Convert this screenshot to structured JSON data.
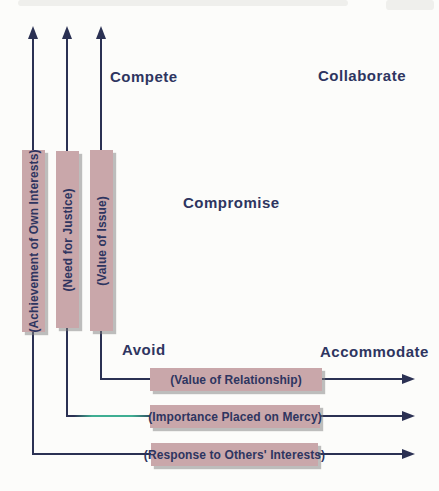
{
  "diagram": {
    "title_hint": "Conflict handling styles diagram",
    "style_labels": {
      "compete": "Compete",
      "collaborate": "Collaborate",
      "compromise": "Compromise",
      "avoid": "Avoid",
      "accommodate": "Accommodate"
    },
    "vertical_axes": [
      {
        "label": "(Achievement of Own Interests)"
      },
      {
        "label": "(Need for Justice)"
      },
      {
        "label": "(Value of Issue)"
      }
    ],
    "horizontal_axes": [
      {
        "label": "(Value of Relationship)"
      },
      {
        "label": "(Importance Placed on Mercy)"
      },
      {
        "label": "(Response to Others' Interests)"
      }
    ],
    "colors": {
      "line": "#2b3153",
      "label_box_fill": "#c9a7aa",
      "text": "#2e3560",
      "green_artifact": "#3fae92",
      "background": "#fcfcfa"
    }
  }
}
